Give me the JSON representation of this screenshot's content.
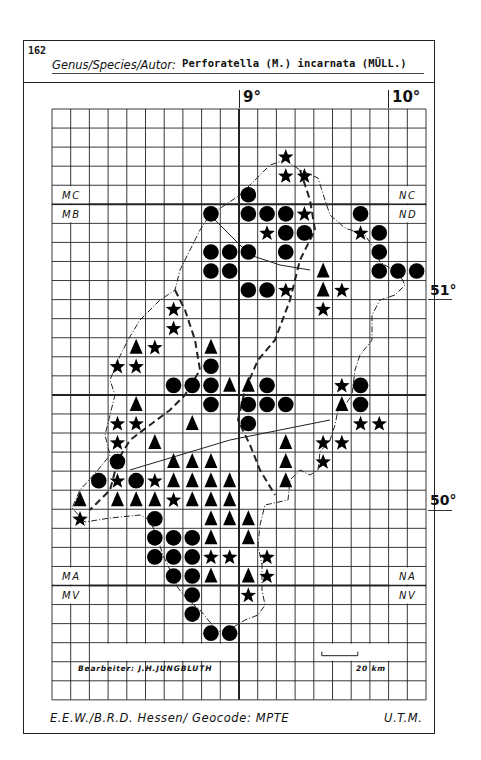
{
  "header": {
    "number": "162",
    "genus_label": "Genus/Species/Autor:",
    "species": "Perforatella (M.) incarnata (MÜLL.)"
  },
  "longitude_labels": [
    {
      "label": "9°",
      "col": 10
    },
    {
      "label": "10°",
      "col": 18
    }
  ],
  "latitude_labels": [
    {
      "label": "51°"
    },
    {
      "label": "50°"
    }
  ],
  "zones": {
    "left_top": "MC",
    "left_bottom": "MB",
    "right_top": "NC",
    "right_bottom": "ND",
    "left_lower_top": "MA",
    "left_lower_bottom": "MV",
    "right_lower_top": "NA",
    "right_lower_bottom": "NV"
  },
  "credit": "Bearbeiter: J.H.JUNGBLUTH",
  "scale": "20 km",
  "footer": {
    "left": "E.E.W./B.R.D. Hessen/ Geocode: MPTE",
    "right": "U.T.M."
  },
  "grid": {
    "cols": 20,
    "rows": 31,
    "x0": 52,
    "y0": 109,
    "cell_w": 18.7,
    "cell_h": 19.06,
    "thick_cols": [
      10
    ],
    "thick_rows": [
      5,
      15,
      25
    ]
  },
  "legend_symbols": {
    "circle": "filled-circle",
    "triangle": "filled-triangle",
    "star": "filled-star"
  },
  "records": [
    {
      "c": 12,
      "r": 2,
      "s": "star"
    },
    {
      "c": 12,
      "r": 3,
      "s": "star"
    },
    {
      "c": 13,
      "r": 3,
      "s": "star"
    },
    {
      "c": 10,
      "r": 4,
      "s": "circle"
    },
    {
      "c": 8,
      "r": 5,
      "s": "circle"
    },
    {
      "c": 10,
      "r": 5,
      "s": "circle"
    },
    {
      "c": 11,
      "r": 5,
      "s": "circle"
    },
    {
      "c": 12,
      "r": 5,
      "s": "circle"
    },
    {
      "c": 13,
      "r": 5,
      "s": "star"
    },
    {
      "c": 16,
      "r": 5,
      "s": "circle"
    },
    {
      "c": 11,
      "r": 6,
      "s": "star"
    },
    {
      "c": 12,
      "r": 6,
      "s": "circle"
    },
    {
      "c": 13,
      "r": 6,
      "s": "circle"
    },
    {
      "c": 16,
      "r": 6,
      "s": "star"
    },
    {
      "c": 17,
      "r": 6,
      "s": "circle"
    },
    {
      "c": 8,
      "r": 7,
      "s": "circle"
    },
    {
      "c": 9,
      "r": 7,
      "s": "circle"
    },
    {
      "c": 10,
      "r": 7,
      "s": "circle"
    },
    {
      "c": 12,
      "r": 7,
      "s": "circle"
    },
    {
      "c": 17,
      "r": 7,
      "s": "circle"
    },
    {
      "c": 8,
      "r": 8,
      "s": "circle"
    },
    {
      "c": 9,
      "r": 8,
      "s": "circle"
    },
    {
      "c": 14,
      "r": 8,
      "s": "triangle"
    },
    {
      "c": 17,
      "r": 8,
      "s": "circle"
    },
    {
      "c": 18,
      "r": 8,
      "s": "circle"
    },
    {
      "c": 19,
      "r": 8,
      "s": "circle"
    },
    {
      "c": 10,
      "r": 9,
      "s": "circle"
    },
    {
      "c": 11,
      "r": 9,
      "s": "circle"
    },
    {
      "c": 12,
      "r": 9,
      "s": "star"
    },
    {
      "c": 14,
      "r": 9,
      "s": "triangle"
    },
    {
      "c": 15,
      "r": 9,
      "s": "star"
    },
    {
      "c": 6,
      "r": 10,
      "s": "star"
    },
    {
      "c": 14,
      "r": 10,
      "s": "star"
    },
    {
      "c": 6,
      "r": 11,
      "s": "star"
    },
    {
      "c": 4,
      "r": 12,
      "s": "triangle"
    },
    {
      "c": 5,
      "r": 12,
      "s": "star"
    },
    {
      "c": 8,
      "r": 12,
      "s": "triangle"
    },
    {
      "c": 3,
      "r": 13,
      "s": "star"
    },
    {
      "c": 4,
      "r": 13,
      "s": "star"
    },
    {
      "c": 8,
      "r": 13,
      "s": "circle"
    },
    {
      "c": 6,
      "r": 14,
      "s": "circle"
    },
    {
      "c": 7,
      "r": 14,
      "s": "circle"
    },
    {
      "c": 8,
      "r": 14,
      "s": "circle"
    },
    {
      "c": 9,
      "r": 14,
      "s": "triangle"
    },
    {
      "c": 10,
      "r": 14,
      "s": "triangle"
    },
    {
      "c": 11,
      "r": 14,
      "s": "circle"
    },
    {
      "c": 15,
      "r": 14,
      "s": "star"
    },
    {
      "c": 16,
      "r": 14,
      "s": "circle"
    },
    {
      "c": 4,
      "r": 15,
      "s": "triangle"
    },
    {
      "c": 8,
      "r": 15,
      "s": "circle"
    },
    {
      "c": 10,
      "r": 15,
      "s": "circle"
    },
    {
      "c": 11,
      "r": 15,
      "s": "circle"
    },
    {
      "c": 12,
      "r": 15,
      "s": "circle"
    },
    {
      "c": 15,
      "r": 15,
      "s": "triangle"
    },
    {
      "c": 16,
      "r": 15,
      "s": "circle"
    },
    {
      "c": 3,
      "r": 16,
      "s": "star"
    },
    {
      "c": 4,
      "r": 16,
      "s": "star"
    },
    {
      "c": 7,
      "r": 16,
      "s": "triangle"
    },
    {
      "c": 10,
      "r": 16,
      "s": "circle"
    },
    {
      "c": 16,
      "r": 16,
      "s": "star"
    },
    {
      "c": 17,
      "r": 16,
      "s": "star"
    },
    {
      "c": 3,
      "r": 17,
      "s": "star"
    },
    {
      "c": 5,
      "r": 17,
      "s": "triangle"
    },
    {
      "c": 12,
      "r": 17,
      "s": "triangle"
    },
    {
      "c": 14,
      "r": 17,
      "s": "star"
    },
    {
      "c": 15,
      "r": 17,
      "s": "star"
    },
    {
      "c": 3,
      "r": 18,
      "s": "circle"
    },
    {
      "c": 6,
      "r": 18,
      "s": "triangle"
    },
    {
      "c": 7,
      "r": 18,
      "s": "triangle"
    },
    {
      "c": 8,
      "r": 18,
      "s": "triangle"
    },
    {
      "c": 12,
      "r": 18,
      "s": "triangle"
    },
    {
      "c": 14,
      "r": 18,
      "s": "star"
    },
    {
      "c": 2,
      "r": 19,
      "s": "circle"
    },
    {
      "c": 3,
      "r": 19,
      "s": "star"
    },
    {
      "c": 4,
      "r": 19,
      "s": "circle"
    },
    {
      "c": 5,
      "r": 19,
      "s": "star"
    },
    {
      "c": 6,
      "r": 19,
      "s": "triangle"
    },
    {
      "c": 7,
      "r": 19,
      "s": "triangle"
    },
    {
      "c": 8,
      "r": 19,
      "s": "triangle"
    },
    {
      "c": 9,
      "r": 19,
      "s": "triangle"
    },
    {
      "c": 12,
      "r": 19,
      "s": "triangle"
    },
    {
      "c": 1,
      "r": 20,
      "s": "triangle"
    },
    {
      "c": 3,
      "r": 20,
      "s": "triangle"
    },
    {
      "c": 4,
      "r": 20,
      "s": "triangle"
    },
    {
      "c": 5,
      "r": 20,
      "s": "triangle"
    },
    {
      "c": 6,
      "r": 20,
      "s": "star"
    },
    {
      "c": 7,
      "r": 20,
      "s": "triangle"
    },
    {
      "c": 8,
      "r": 20,
      "s": "triangle"
    },
    {
      "c": 9,
      "r": 20,
      "s": "triangle"
    },
    {
      "c": 1,
      "r": 21,
      "s": "star"
    },
    {
      "c": 5,
      "r": 21,
      "s": "circle"
    },
    {
      "c": 8,
      "r": 21,
      "s": "triangle"
    },
    {
      "c": 9,
      "r": 21,
      "s": "triangle"
    },
    {
      "c": 10,
      "r": 21,
      "s": "triangle"
    },
    {
      "c": 5,
      "r": 22,
      "s": "circle"
    },
    {
      "c": 6,
      "r": 22,
      "s": "circle"
    },
    {
      "c": 7,
      "r": 22,
      "s": "circle"
    },
    {
      "c": 8,
      "r": 22,
      "s": "triangle"
    },
    {
      "c": 10,
      "r": 22,
      "s": "triangle"
    },
    {
      "c": 5,
      "r": 23,
      "s": "circle"
    },
    {
      "c": 6,
      "r": 23,
      "s": "circle"
    },
    {
      "c": 7,
      "r": 23,
      "s": "circle"
    },
    {
      "c": 8,
      "r": 23,
      "s": "star"
    },
    {
      "c": 9,
      "r": 23,
      "s": "star"
    },
    {
      "c": 11,
      "r": 23,
      "s": "star"
    },
    {
      "c": 6,
      "r": 24,
      "s": "circle"
    },
    {
      "c": 7,
      "r": 24,
      "s": "circle"
    },
    {
      "c": 8,
      "r": 24,
      "s": "triangle"
    },
    {
      "c": 10,
      "r": 24,
      "s": "triangle"
    },
    {
      "c": 11,
      "r": 24,
      "s": "star"
    },
    {
      "c": 7,
      "r": 25,
      "s": "circle"
    },
    {
      "c": 10,
      "r": 25,
      "s": "star"
    },
    {
      "c": 7,
      "r": 26,
      "s": "circle"
    },
    {
      "c": 8,
      "r": 27,
      "s": "circle"
    },
    {
      "c": 9,
      "r": 27,
      "s": "circle"
    }
  ]
}
